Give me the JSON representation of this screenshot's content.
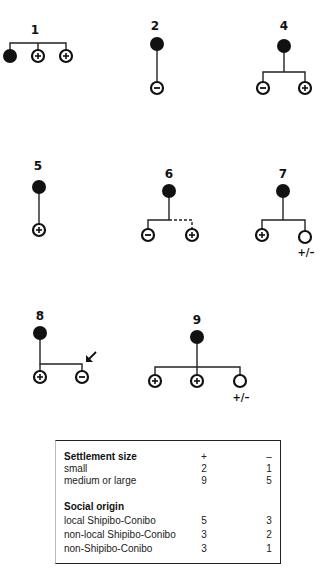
{
  "diagrams": [
    {
      "id": "1",
      "label": "1",
      "nodes": [
        "filled",
        "plus",
        "plus"
      ]
    },
    {
      "id": "2",
      "label": "2",
      "nodes": [
        "filled",
        "minus"
      ]
    },
    {
      "id": "4",
      "label": "4",
      "nodes": [
        "filled",
        "minus",
        "plus"
      ]
    },
    {
      "id": "5",
      "label": "5",
      "nodes": [
        "filled",
        "plus"
      ]
    },
    {
      "id": "6",
      "label": "6",
      "nodes": [
        "filled",
        "minus",
        "plus"
      ],
      "note": "dashed link to plus"
    },
    {
      "id": "7",
      "label": "7",
      "nodes": [
        "filled",
        "plus",
        "open"
      ],
      "open_label": "+/–"
    },
    {
      "id": "8",
      "label": "8",
      "nodes": [
        "filled",
        "plus",
        "minus"
      ],
      "note": "arrow pointing at minus"
    },
    {
      "id": "9",
      "label": "9",
      "nodes": [
        "filled",
        "plus",
        "plus",
        "open"
      ],
      "open_label": "+/–"
    }
  ],
  "legend_symbols": {
    "filled": "filled-circle",
    "plus": "circle-plus",
    "minus": "circle-minus",
    "open": "open-circle",
    "arrow": "arrow-icon"
  },
  "table": {
    "columns": [
      "",
      "+",
      "–"
    ],
    "sections": [
      {
        "heading": "Settlement size",
        "header_plus": "+",
        "header_minus": "–",
        "rows": [
          {
            "label": "small",
            "plus": "2",
            "minus": "1"
          },
          {
            "label": "medium or large",
            "plus": "9",
            "minus": "5"
          }
        ]
      },
      {
        "heading": "Social origin",
        "rows": [
          {
            "label": "local Shipibo-Conibo",
            "plus": "5",
            "minus": "3"
          },
          {
            "label": "non-local Shipibo-Conibo",
            "plus": "3",
            "minus": "2"
          },
          {
            "label": "non-Shipibo-Conibo",
            "plus": "3",
            "minus": "1"
          }
        ]
      }
    ]
  }
}
